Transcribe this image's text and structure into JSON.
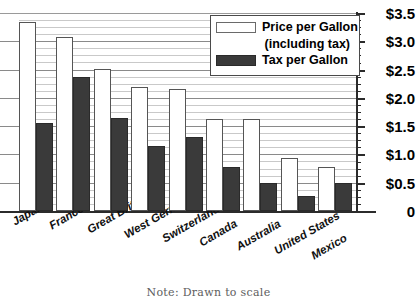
{
  "chart_data": {
    "type": "bar",
    "title": "",
    "xlabel": "",
    "ylabel": "",
    "ylim": [
      0,
      3.5
    ],
    "grid": true,
    "grid_major_step": 0.5,
    "grid_minor_step": 0.125,
    "legend_position": "top-right",
    "categories": [
      "Japan",
      "France",
      "Great Britain",
      "West Germany",
      "Switzerland",
      "Canada",
      "Australia",
      "United States",
      "Mexico"
    ],
    "series": [
      {
        "name": "Price per Gallon (including tax)",
        "color": "#ffffff",
        "values": [
          3.34,
          3.07,
          2.51,
          2.19,
          2.15,
          1.63,
          1.63,
          0.93,
          0.78
        ]
      },
      {
        "name": "Tax per Gallon",
        "color": "#3a3a3a",
        "values": [
          1.55,
          2.37,
          1.65,
          1.15,
          1.31,
          0.78,
          0.5,
          0.27,
          0.5
        ]
      }
    ],
    "ytick_labels": [
      "$3.5",
      "$3.0",
      "$2.5",
      "$2.0",
      "$1.5",
      "$1.0",
      "$0.5",
      "0"
    ],
    "ytick_values": [
      3.5,
      3.0,
      2.5,
      2.0,
      1.5,
      1.0,
      0.5,
      0
    ],
    "annotations": [
      "Note: Drawn to scale"
    ]
  },
  "legend": {
    "price_label": "Price per Gallon",
    "price_sublabel": "(including tax)",
    "tax_label": "Tax per Gallon"
  },
  "note": {
    "text": "Note: Drawn to scale"
  },
  "colors": {
    "tax_fill": "#3a3a3a",
    "price_fill": "#ffffff",
    "axis": "#2b2b2b",
    "major_grid": "#8a8a8a",
    "minor_grid": "#c9c9c9"
  }
}
